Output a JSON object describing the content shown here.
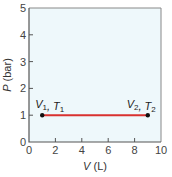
{
  "chart_data": {
    "type": "line",
    "title": "",
    "xlabel": "V (L)",
    "ylabel": "P (bar)",
    "xlim": [
      0,
      10
    ],
    "ylim": [
      0,
      5
    ],
    "xticks": [
      0,
      2,
      4,
      6,
      8,
      10
    ],
    "yticks": [
      0,
      1,
      2,
      3,
      4,
      5
    ],
    "grid": false,
    "legend": null,
    "series": [
      {
        "name": "isobaric process",
        "x": [
          1,
          9
        ],
        "y": [
          1,
          1
        ],
        "color": "#d9312f"
      }
    ],
    "annotations": [
      {
        "text": "V1, T1",
        "x": 1,
        "y": 1,
        "main1": "V",
        "sub1": "1",
        "main2": "T",
        "sub2": "1"
      },
      {
        "text": "V2, T2",
        "x": 9,
        "y": 1,
        "main1": "V",
        "sub1": "2",
        "main2": "T",
        "sub2": "2"
      }
    ]
  },
  "style": {
    "plot_bg": "#eef8fb",
    "axis_color": "#555555",
    "line_color": "#d9312f",
    "point_color": "#111111"
  },
  "labels": {
    "x_axis_main": "V",
    "x_axis_unit": " (L)",
    "y_axis_main": "P",
    "y_axis_unit": " (bar)"
  }
}
